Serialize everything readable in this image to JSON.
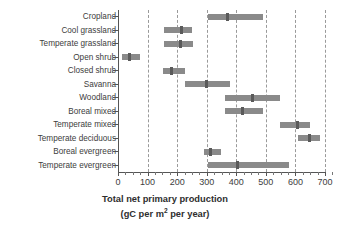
{
  "chart_data": {
    "type": "bar",
    "orientation": "horizontal",
    "subtype": "range-bar-with-median",
    "title": "",
    "xlabel": "Total net primary production (gC per m2 per year)",
    "xlabel_line1": "Total net primary production",
    "xlabel_line2_prefix": "(gC per m",
    "xlabel_line2_sup": "2",
    "xlabel_line2_suffix": " per year)",
    "ylabel": "",
    "xlim": [
      0,
      730
    ],
    "xticks": [
      0,
      100,
      200,
      300,
      400,
      500,
      600,
      700
    ],
    "xtick_labels": [
      "0",
      "100",
      "200",
      "300",
      "400",
      "500",
      "600",
      "700"
    ],
    "minor_tick_step": 25,
    "grid": "vertical-dashed",
    "legend": "none",
    "bar_color": "#8a8a8a",
    "median_color": "#5a5a5a",
    "grid_color": "#9a9a9a",
    "categories": [
      "Cropland",
      "Cool grassland",
      "Temperate grassland",
      "Open shrub",
      "Closed shrub",
      "Savanna",
      "Woodland",
      "Boreal mixed",
      "Temperate mixed",
      "Temperate deciduous",
      "Boreal evergreen",
      "Temperate evergreen"
    ],
    "ranges": [
      {
        "category": "Cropland",
        "min": 305,
        "max": 490,
        "median": 370
      },
      {
        "category": "Cool grassland",
        "min": 155,
        "max": 250,
        "median": 215
      },
      {
        "category": "Temperate grassland",
        "min": 155,
        "max": 255,
        "median": 210
      },
      {
        "category": "Open shrub",
        "min": 15,
        "max": 75,
        "median": 38
      },
      {
        "category": "Closed shrub",
        "min": 152,
        "max": 228,
        "median": 182
      },
      {
        "category": "Savanna",
        "min": 225,
        "max": 378,
        "median": 300
      },
      {
        "category": "Woodland",
        "min": 362,
        "max": 548,
        "median": 455
      },
      {
        "category": "Boreal mixed",
        "min": 362,
        "max": 490,
        "median": 420
      },
      {
        "category": "Temperate mixed",
        "min": 548,
        "max": 648,
        "median": 608
      },
      {
        "category": "Temperate deciduous",
        "min": 608,
        "max": 682,
        "median": 648
      },
      {
        "category": "Boreal evergreen",
        "min": 292,
        "max": 348,
        "median": 312
      },
      {
        "category": "Temperate evergreen",
        "min": 305,
        "max": 578,
        "median": 405
      }
    ]
  }
}
